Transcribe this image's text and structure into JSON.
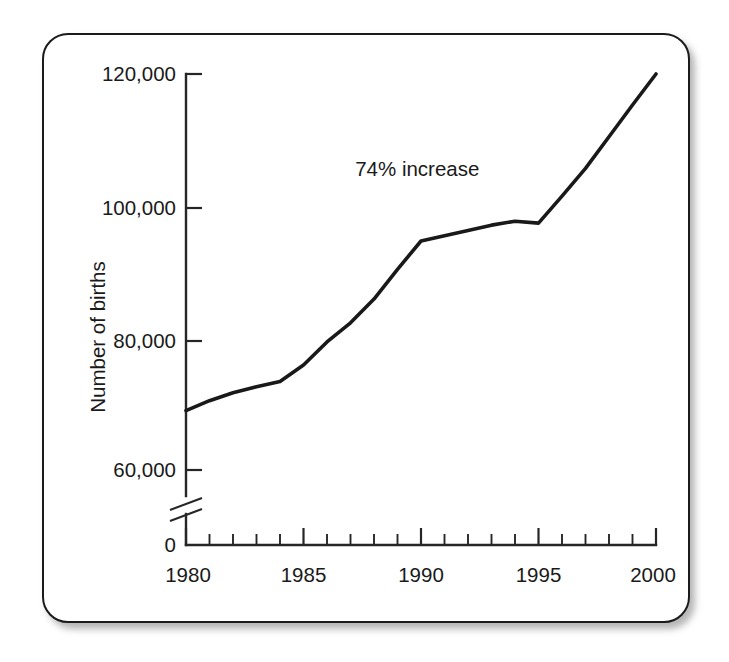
{
  "figure": {
    "frame_color": "#1b1b1b",
    "background": "#ffffff",
    "line_color": "#191919"
  },
  "axes": {
    "y_title": "Number of births",
    "y_tick_labels": [
      "120,000",
      "100,000",
      "80,000",
      "60,000",
      "0"
    ],
    "x_tick_labels": [
      "1980",
      "1985",
      "1990",
      "1995",
      "2000"
    ],
    "y_axis_break": "axis-break-zigzag"
  },
  "annotations": [
    {
      "text": "74% increase",
      "x": 1987.2,
      "y": 104500
    }
  ],
  "chart_data": {
    "type": "line",
    "title": "",
    "xlabel": "",
    "ylabel": "Number of births",
    "xlim": [
      1980,
      2000
    ],
    "ylim": [
      56000,
      122000
    ],
    "y_axis_broken": true,
    "y_break_below": 56000,
    "grid": false,
    "legend": null,
    "x_ticks_major": [
      1980,
      1985,
      1990,
      1995,
      2000
    ],
    "x_ticks_minor_step": 1,
    "y_ticks": [
      60000,
      80000,
      100000,
      120000
    ],
    "series": [
      {
        "name": "Number of births",
        "x": [
          1980,
          1981,
          1982,
          1983,
          1984,
          1985,
          1986,
          1987,
          1988,
          1989,
          1990,
          1991,
          1992,
          1993,
          1994,
          1995,
          1996,
          1997,
          1998,
          1999,
          2000
        ],
        "values": [
          69000,
          70500,
          71700,
          72600,
          73400,
          75900,
          79400,
          82300,
          85900,
          90400,
          94700,
          95500,
          96300,
          97100,
          97700,
          97400,
          101500,
          105700,
          110500,
          115300,
          120000
        ]
      }
    ],
    "annotations": [
      "74% increase"
    ]
  }
}
